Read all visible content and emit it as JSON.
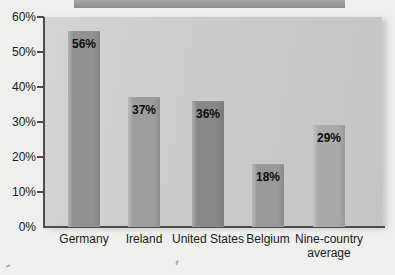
{
  "chart_data": {
    "type": "bar",
    "title": "",
    "xlabel": "",
    "ylabel": "",
    "categories": [
      "Germany",
      "Ireland",
      "United States",
      "Belgium",
      "Nine-country average"
    ],
    "values": [
      56,
      37,
      36,
      18,
      29
    ],
    "value_labels": [
      "56%",
      "37%",
      "36%",
      "18%",
      "29%"
    ],
    "bar_colors": [
      "#919191",
      "#9d9d9d",
      "#888888",
      "#999999",
      "#a9a9a9"
    ],
    "ylim": [
      0,
      60
    ],
    "ytick_step": 10,
    "ytick_labels_top_to_bottom": [
      "60%",
      "50%",
      "40%",
      "30%",
      "20%",
      "10%",
      "0%"
    ],
    "grid": false,
    "legend": false,
    "value_label_position": "inside-top",
    "panel_color": "#cbcbc9",
    "axis_color": "#4c4c4c",
    "text_color": "#1a1a1a"
  }
}
